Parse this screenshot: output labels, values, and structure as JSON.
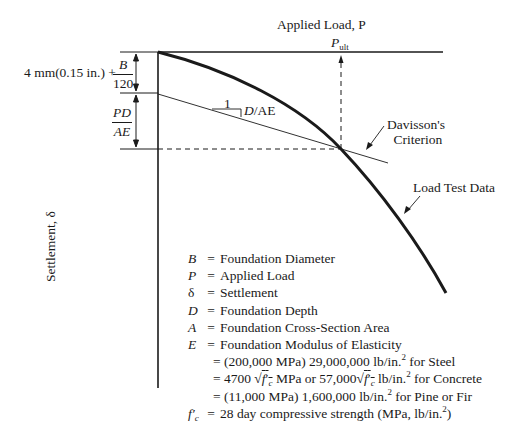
{
  "diagram": {
    "x_axis_label": "Applied Load, P",
    "y_axis_label": "Settlement, δ",
    "p_ult_label": "P",
    "p_ult_subscript": "ult",
    "offset_label": "4 mm(0.15 in.) +",
    "offset_fraction": {
      "numerator": "B",
      "denominator": "120"
    },
    "elastic_fraction": {
      "numerator": "PD",
      "denominator": "AE"
    },
    "slope_rise": "1",
    "slope_run_italic": "D",
    "slope_run_rest": "/AE",
    "davisson_label_line1": "Davisson's",
    "davisson_label_line2": "Criterion",
    "load_test_label": "Load Test Data"
  },
  "legend": [
    {
      "symbol": "B",
      "eq": "=",
      "text": "Foundation Diameter"
    },
    {
      "symbol": "P",
      "eq": "=",
      "text": "Applied Load"
    },
    {
      "symbol": "δ",
      "eq": "=",
      "text": "Settlement"
    },
    {
      "symbol": "D",
      "eq": "=",
      "text": "Foundation Depth"
    },
    {
      "symbol": "A",
      "eq": "=",
      "text": "Foundation Cross-Section Area"
    },
    {
      "symbol": "E",
      "eq": "=",
      "text": "Foundation Modulus of Elasticity"
    }
  ],
  "modulus_values": {
    "steel_a": "= (200,000 MPa) 29,000,000 lb/in.",
    "steel_b": " for Steel",
    "concrete_a": "= 4700 √",
    "concrete_b": " MPa or 57,000√",
    "concrete_c": " lb/in.",
    "concrete_d": " for Concrete",
    "pine_a": "= (11,000 MPa) 1,600,000 lb/in.",
    "pine_b": " for Pine or Fir",
    "sq": "2",
    "fc": "f",
    "fc_prime": "′",
    "fc_sub": "c"
  },
  "fc_definition": {
    "eq": "=",
    "text_a": "28 day compressive strength (MPa, lb/in.",
    "text_b": ")"
  }
}
